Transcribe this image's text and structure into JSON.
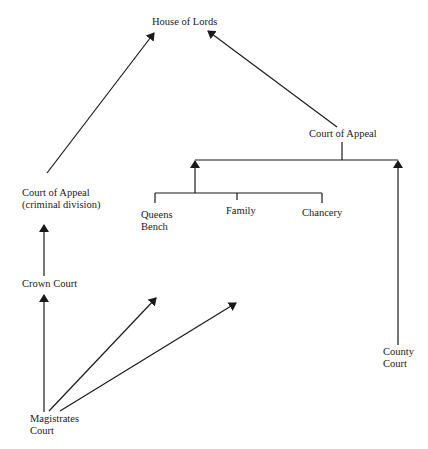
{
  "diagram": {
    "type": "court-hierarchy",
    "nodes": {
      "house_of_lords": {
        "label": "House of Lords"
      },
      "court_of_appeal_criminal": {
        "line1": "Court of Appeal",
        "line2": "(criminal division)"
      },
      "court_of_appeal_civil": {
        "label": "Court of Appeal"
      },
      "queens_bench": {
        "line1": "Queens",
        "line2": "Bench"
      },
      "family": {
        "label": "Family"
      },
      "chancery": {
        "label": "Chancery"
      },
      "crown_court": {
        "label": "Crown Court"
      },
      "county_court": {
        "line1": "County",
        "line2": "Court"
      },
      "magistrates_court": {
        "line1": "Magistrates",
        "line2": "Court"
      }
    },
    "edges": [
      {
        "from": "Court of Appeal (criminal division)",
        "to": "House of Lords"
      },
      {
        "from": "Court of Appeal",
        "to": "House of Lords"
      },
      {
        "from": "Crown Court",
        "to": "Court of Appeal (criminal division)"
      },
      {
        "from": "Magistrates Court",
        "to": "Crown Court"
      },
      {
        "from": "Magistrates Court",
        "to": "Queens Bench"
      },
      {
        "from": "Magistrates Court",
        "to": "Family"
      },
      {
        "from": "High Court divisions (Queens Bench, Family, Chancery)",
        "to": "Court of Appeal"
      },
      {
        "from": "County Court",
        "to": "Court of Appeal"
      }
    ],
    "colors": {
      "line": "#1a1a1a",
      "background": "#ffffff"
    }
  }
}
